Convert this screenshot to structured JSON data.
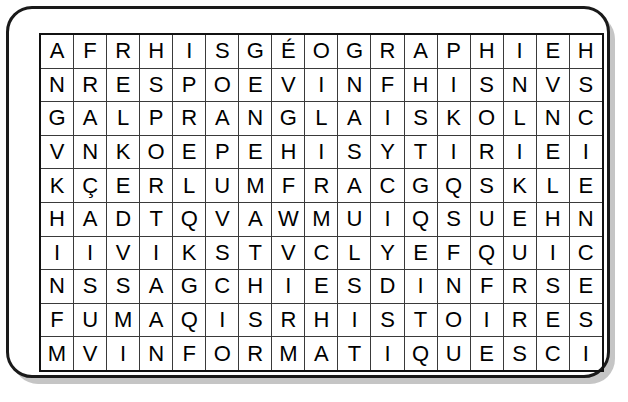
{
  "document": {
    "type": "word-search-puzzle",
    "language": "French",
    "frame": {
      "shape": "rounded-rectangle",
      "border_color": "#1a1a1a",
      "shadow_color": "#969696",
      "background": "#ffffff"
    },
    "grid": {
      "rows": 10,
      "columns": 17,
      "cell_border_color": "#3a3a3a",
      "outer_border_color": "#111111",
      "letter_color": "#000000",
      "letters": [
        [
          "A",
          "F",
          "R",
          "H",
          "I",
          "S",
          "G",
          "É",
          "O",
          "G",
          "R",
          "A",
          "P",
          "H",
          "I",
          "E",
          "H"
        ],
        [
          "N",
          "R",
          "E",
          "S",
          "P",
          "O",
          "E",
          "V",
          "I",
          "N",
          "F",
          "H",
          "I",
          "S",
          "N",
          "V",
          "S"
        ],
        [
          "G",
          "A",
          "L",
          "P",
          "R",
          "A",
          "N",
          "G",
          "L",
          "A",
          "I",
          "S",
          "K",
          "O",
          "L",
          "N",
          "C"
        ],
        [
          "V",
          "N",
          "K",
          "O",
          "E",
          "P",
          "E",
          "H",
          "I",
          "S",
          "Y",
          "T",
          "I",
          "R",
          "I",
          "E",
          "I"
        ],
        [
          "K",
          "Ç",
          "E",
          "R",
          "L",
          "U",
          "M",
          "F",
          "R",
          "A",
          "C",
          "G",
          "Q",
          "S",
          "K",
          "L",
          "E"
        ],
        [
          "H",
          "A",
          "D",
          "T",
          "Q",
          "V",
          "A",
          "W",
          "M",
          "U",
          "I",
          "Q",
          "S",
          "U",
          "E",
          "H",
          "N"
        ],
        [
          "I",
          "I",
          "V",
          "I",
          "K",
          "S",
          "T",
          "V",
          "C",
          "L",
          "Y",
          "E",
          "F",
          "Q",
          "U",
          "I",
          "C"
        ],
        [
          "N",
          "S",
          "S",
          "A",
          "G",
          "C",
          "H",
          "I",
          "E",
          "S",
          "D",
          "I",
          "N",
          "F",
          "R",
          "S",
          "E"
        ],
        [
          "F",
          "U",
          "M",
          "A",
          "Q",
          "I",
          "S",
          "R",
          "H",
          "I",
          "S",
          "T",
          "O",
          "I",
          "R",
          "E",
          "S"
        ],
        [
          "M",
          "V",
          "I",
          "N",
          "F",
          "O",
          "R",
          "M",
          "A",
          "T",
          "I",
          "Q",
          "U",
          "E",
          "S",
          "C",
          "I"
        ]
      ]
    }
  }
}
